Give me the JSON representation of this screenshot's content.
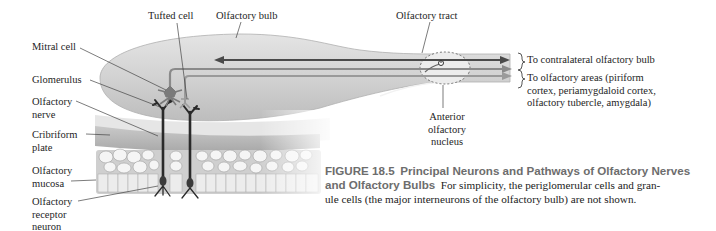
{
  "diagram": {
    "type": "anatomical-diagram",
    "subject": "Olfactory nerves and olfactory bulbs",
    "labels": {
      "tufted_cell": "Tufted cell",
      "olfactory_bulb": "Olfactory bulb",
      "olfactory_tract": "Olfactory tract",
      "mitral_cell": "Mitral cell",
      "glomerulus": "Glomerulus",
      "olfactory_nerve_1": "Olfactory",
      "olfactory_nerve_2": "nerve",
      "cribriform_1": "Cribriform",
      "cribriform_2": "plate",
      "mucosa_1": "Olfactory",
      "mucosa_2": "mucosa",
      "receptor_1": "Olfactory",
      "receptor_2": "receptor",
      "receptor_3": "neuron",
      "aon_1": "Anterior",
      "aon_2": "olfactory",
      "aon_3": "nucleus",
      "contralateral": "To contralateral olfactory bulb",
      "areas_1": "To olfactory areas (piriform",
      "areas_2": "cortex, periamygdaloid cortex,",
      "areas_3": "olfactory tubercle, amygdala)"
    },
    "caption": {
      "figure_number": "FIGURE 18.5",
      "title_1": "Principal Neurons and Pathways of Olfactory Nerves",
      "title_2": "and Olfactory Bulbs",
      "body_1": "For simplicity, the periglomerular cells and gran-",
      "body_2": "ule cells (the major interneurons of the olfactory bulb) are not shown."
    },
    "colors": {
      "bulb_fill": "#d6d6d6",
      "tract_line_dark": "#4a4a4a",
      "tract_line_mid": "#8a8a8a",
      "neuron_dark": "#2a2a2a",
      "caption_heading": "#6d6d6d"
    }
  }
}
